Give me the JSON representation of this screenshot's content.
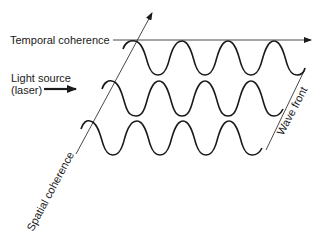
{
  "diagram": {
    "labels": {
      "temporal": "Temporal coherence",
      "source_line1": "Light source",
      "source_line2": "(laser)",
      "spatial": "Spatial coherence",
      "wave_front": "Wave front"
    },
    "colors": {
      "ink": "#1a1a1a",
      "background": "#ffffff"
    },
    "waves": [
      {
        "row": 1,
        "start_x": 123,
        "peak_y": 41,
        "trough_y": 75,
        "cycles": 4
      },
      {
        "row": 2,
        "start_x": 102,
        "peak_y": 81,
        "trough_y": 116,
        "cycles": 4
      },
      {
        "row": 3,
        "start_x": 81,
        "peak_y": 121,
        "trough_y": 155,
        "cycles": 4
      }
    ]
  }
}
